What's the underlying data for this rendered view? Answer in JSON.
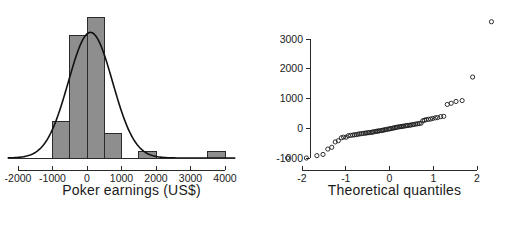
{
  "figure": {
    "background": "#ffffff",
    "bar_fill": "#8e8e8e",
    "bar_stroke": "#2b2b2b",
    "curve_color": "#111111",
    "point_color": "#1b1b1b"
  },
  "chart_data": [
    {
      "type": "bar",
      "id": "histogram",
      "title": "",
      "xlabel": "Poker earnings (US$)",
      "ylabel": "",
      "grid": false,
      "legend": null,
      "xlim": [
        -2300,
        4300
      ],
      "ylim": [
        0,
        26
      ],
      "xticks": [
        -2000,
        -1000,
        0,
        1000,
        2000,
        3000,
        4000
      ],
      "xticklabels": [
        "-2000",
        "-1000",
        "0",
        "1000",
        "2000",
        "3000",
        "4000"
      ],
      "yticks": [],
      "yticklabels": [],
      "bin_width": 500,
      "bin_edges": [
        -1000,
        -500,
        0,
        500,
        1000,
        1500,
        2000,
        2500,
        3000,
        3500,
        4000
      ],
      "bin_centers": [
        -750,
        -250,
        250,
        750,
        1250,
        1750,
        2250,
        2750,
        3250,
        3750
      ],
      "counts": [
        6,
        20,
        23,
        4,
        0,
        1,
        0,
        0,
        0,
        1
      ],
      "categories": [
        "-1000 to -500",
        "-500 to 0",
        "0 to 500",
        "500 to 1000",
        "1000 to 1500",
        "1500 to 2000",
        "2000 to 2500",
        "2500 to 3000",
        "3000 to 3500",
        "3500 to 4000"
      ],
      "values": [
        6,
        20,
        23,
        4,
        0,
        1,
        0,
        0,
        0,
        1
      ],
      "overlay_curve": {
        "name": "normal density",
        "mean": 100,
        "sd": 640,
        "peak_value": 20.5
      }
    },
    {
      "type": "scatter",
      "id": "qq-plot",
      "title": "",
      "xlabel": "Theoretical quantiles",
      "ylabel": "",
      "grid": false,
      "legend": null,
      "xlim": [
        -2.45,
        2.45
      ],
      "ylim": [
        -1350,
        3750
      ],
      "xticks": [
        -2,
        -1,
        0,
        1,
        2
      ],
      "xticklabels": [
        "-2",
        "-1",
        "0",
        "1",
        "2"
      ],
      "yticks": [
        -1000,
        0,
        1000,
        2000,
        3000
      ],
      "yticklabels": [
        "-1000",
        "0",
        "1000",
        "2000",
        "3000"
      ],
      "x": [
        -2.33,
        -1.9,
        -1.66,
        -1.52,
        -1.41,
        -1.32,
        -1.24,
        -1.17,
        -1.1,
        -1.05,
        -0.99,
        -0.94,
        -0.89,
        -0.84,
        -0.8,
        -0.76,
        -0.72,
        -0.68,
        -0.64,
        -0.6,
        -0.56,
        -0.53,
        -0.49,
        -0.46,
        -0.42,
        -0.39,
        -0.36,
        -0.32,
        -0.29,
        -0.26,
        -0.23,
        -0.19,
        -0.16,
        -0.13,
        -0.1,
        -0.07,
        -0.03,
        0.0,
        0.03,
        0.07,
        0.1,
        0.13,
        0.16,
        0.19,
        0.23,
        0.26,
        0.29,
        0.32,
        0.36,
        0.39,
        0.42,
        0.46,
        0.49,
        0.53,
        0.56,
        0.6,
        0.64,
        0.68,
        0.72,
        0.76,
        0.8,
        0.84,
        0.89,
        0.94,
        0.99,
        1.05,
        1.1,
        1.17,
        1.24,
        1.32,
        1.41,
        1.52,
        1.66,
        1.9,
        2.33
      ],
      "y": [
        -1000,
        -1000,
        -920,
        -880,
        -700,
        -640,
        -460,
        -420,
        -320,
        -300,
        -300,
        -250,
        -240,
        -230,
        -220,
        -215,
        -200,
        -190,
        -180,
        -175,
        -165,
        -160,
        -150,
        -145,
        -140,
        -130,
        -120,
        -110,
        -100,
        -95,
        -85,
        -80,
        -70,
        -60,
        -50,
        -40,
        -30,
        -20,
        -10,
        0,
        10,
        20,
        30,
        40,
        50,
        55,
        60,
        70,
        80,
        90,
        95,
        100,
        110,
        120,
        130,
        140,
        150,
        160,
        170,
        250,
        270,
        290,
        300,
        310,
        330,
        350,
        360,
        390,
        400,
        800,
        840,
        900,
        930,
        1720,
        3580
      ]
    }
  ]
}
